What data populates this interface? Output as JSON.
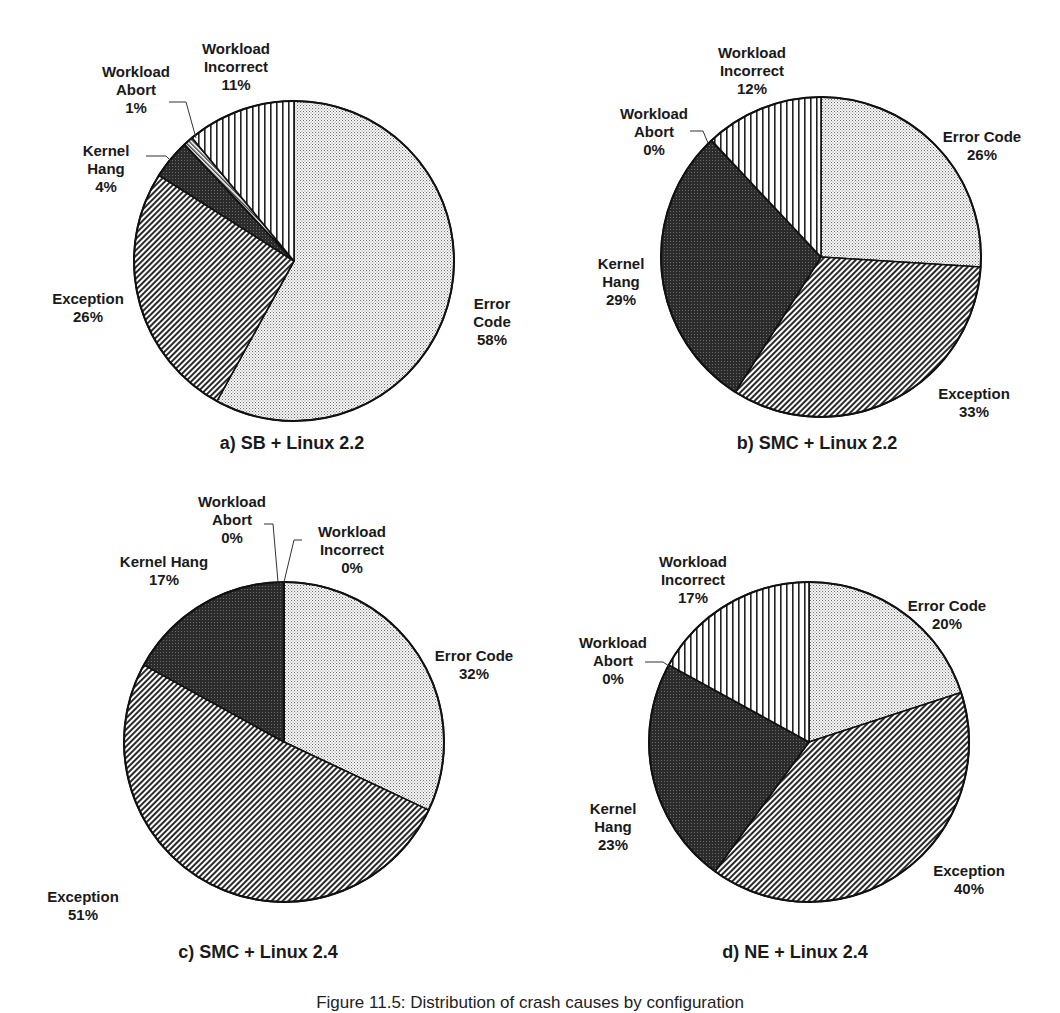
{
  "figure_caption": "Figure 11.5: Distribution of crash causes by configuration",
  "legend_order": [
    "Error Code",
    "Exception",
    "Kernel Hang",
    "Workload Abort",
    "Workload Incorrect"
  ],
  "colors": {
    "outline": "#111111",
    "error_code_dot": "#6e6e6e",
    "exception_line": "#2a2a2a",
    "kernel_hang_fill": "#2b2b2b",
    "workload_abort_line": "#3a3a3a",
    "workload_incorrect_line": "#222222"
  },
  "chart_data": [
    {
      "type": "pie",
      "title": "a) SB + Linux 2.2",
      "categories": [
        "Error Code",
        "Exception",
        "Kernel Hang",
        "Workload Abort",
        "Workload Incorrect"
      ],
      "values": [
        58,
        26,
        4,
        1,
        11
      ],
      "labels": [
        "Error\nCode\n58%",
        "Exception\n26%",
        "Kernel\nHang\n4%",
        "Workload\nAbort\n1%",
        "Workload\nIncorrect\n11%"
      ],
      "start_angle_deg": 0,
      "direction": "clockwise"
    },
    {
      "type": "pie",
      "title": "b) SMC + Linux 2.2",
      "categories": [
        "Error Code",
        "Exception",
        "Kernel Hang",
        "Workload Abort",
        "Workload Incorrect"
      ],
      "values": [
        26,
        33,
        29,
        0,
        12
      ],
      "labels": [
        "Error Code\n26%",
        "Exception\n33%",
        "Kernel\nHang\n29%",
        "Workload\nAbort\n0%",
        "Workload\nIncorrect\n12%"
      ],
      "start_angle_deg": 0,
      "direction": "clockwise"
    },
    {
      "type": "pie",
      "title": "c) SMC + Linux 2.4",
      "categories": [
        "Error Code",
        "Exception",
        "Kernel Hang",
        "Workload Abort",
        "Workload Incorrect"
      ],
      "values": [
        32,
        51,
        17,
        0,
        0
      ],
      "labels": [
        "Error Code\n32%",
        "Exception\n51%",
        "Kernel Hang\n17%",
        "Workload\nAbort\n0%",
        "Workload\nIncorrect\n0%"
      ],
      "start_angle_deg": 0,
      "direction": "clockwise"
    },
    {
      "type": "pie",
      "title": "d) NE + Linux 2.4",
      "categories": [
        "Error Code",
        "Exception",
        "Kernel Hang",
        "Workload Abort",
        "Workload Incorrect"
      ],
      "values": [
        20,
        40,
        23,
        0,
        17
      ],
      "labels": [
        "Error Code\n20%",
        "Exception\n40%",
        "Kernel\nHang\n23%",
        "Workload\nAbort\n0%",
        "Workload\nIncorrect\n17%"
      ],
      "start_angle_deg": 0,
      "direction": "clockwise"
    }
  ],
  "layout": {
    "pies": [
      {
        "cx": 294,
        "cy": 261,
        "r": 160,
        "subtitle_pos": [
          292,
          443
        ],
        "label_pos": [
          [
            492,
            295
          ],
          [
            88,
            290
          ],
          [
            106,
            142
          ],
          [
            136,
            63
          ],
          [
            236,
            40
          ]
        ],
        "leaders": [
          [],
          [],
          [
            [
              146,
              156
            ],
            [
              166,
              156
            ],
            [
              180,
              170
            ]
          ],
          [
            [
              169,
              102
            ],
            [
              186,
              102
            ],
            [
              196,
              138
            ]
          ],
          []
        ]
      },
      {
        "cx": 821,
        "cy": 257,
        "r": 160,
        "subtitle_pos": [
          817,
          443
        ],
        "label_pos": [
          [
            982,
            128
          ],
          [
            974,
            385
          ],
          [
            621,
            255
          ],
          [
            654,
            105
          ],
          [
            752,
            44
          ]
        ],
        "leaders": [
          [],
          [],
          [],
          [
            [
              690,
              131
            ],
            [
              703,
              131
            ],
            [
              708,
              143
            ]
          ],
          []
        ]
      },
      {
        "cx": 284,
        "cy": 742,
        "r": 160,
        "subtitle_pos": [
          258,
          952
        ],
        "label_pos": [
          [
            474,
            647
          ],
          [
            83,
            888
          ],
          [
            164,
            553
          ],
          [
            232,
            493
          ],
          [
            352,
            523
          ]
        ],
        "leaders": [
          [],
          [],
          [],
          [
            [
              264,
              524
            ],
            [
              273,
              524
            ],
            [
              278,
              582
            ]
          ],
          [
            [
              302,
              540
            ],
            [
              294,
              540
            ],
            [
              284,
              582
            ]
          ]
        ]
      },
      {
        "cx": 809,
        "cy": 742,
        "r": 160,
        "subtitle_pos": [
          795,
          952
        ],
        "label_pos": [
          [
            947,
            597
          ],
          [
            969,
            862
          ],
          [
            613,
            800
          ],
          [
            613,
            634
          ],
          [
            693,
            553
          ]
        ],
        "leaders": [
          [],
          [],
          [],
          [
            [
              645,
              662
            ],
            [
              663,
              662
            ],
            [
              669,
              666
            ]
          ],
          []
        ]
      }
    ]
  }
}
